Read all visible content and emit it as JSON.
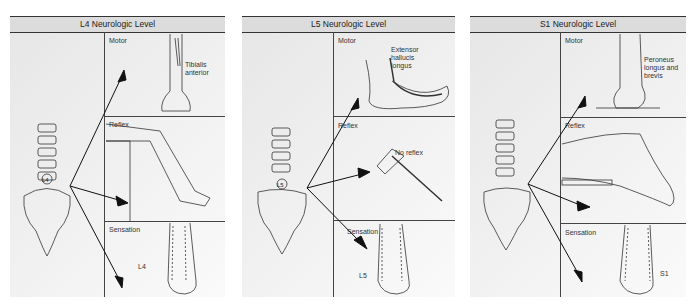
{
  "panels": [
    {
      "title": "L4 Neurologic Level",
      "motor_label": "Motor",
      "motor_muscle": "Tibialis anterior",
      "reflex_label": "Reflex",
      "sensation_label": "Sensation",
      "dermatome_label": "L4",
      "vertebra_label": "L4"
    },
    {
      "title": "L5 Neurologic Level",
      "motor_label": "Motor",
      "motor_muscle": "Extensor hallucis longus",
      "reflex_label": "Reflex",
      "reflex_note": "No reflex",
      "sensation_label": "Sensation",
      "dermatome_label": "L5",
      "vertebra_label": "L5"
    },
    {
      "title": "S1 Neurologic Level",
      "motor_label": "Motor",
      "motor_muscle": "Peroneus longus and brevis",
      "reflex_label": "Reflex",
      "sensation_label": "Sensation",
      "dermatome_label": "S1"
    }
  ]
}
